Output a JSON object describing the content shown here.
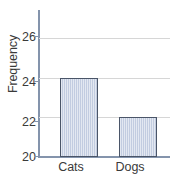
{
  "chart_data": {
    "type": "bar",
    "title": "",
    "subtitle": "",
    "xlabel": "",
    "ylabel": "Frequency",
    "categories": [
      "Cats",
      "Dogs"
    ],
    "values": [
      24,
      22
    ],
    "series": [
      {
        "name": "Frequency",
        "values": [
          24,
          22
        ]
      }
    ],
    "yticks": [
      20,
      22,
      24,
      26
    ],
    "ytick_labels": [
      "20",
      "22",
      "24",
      "26"
    ],
    "ylim": [
      20,
      26.8
    ],
    "xlim": [
      0,
      2
    ],
    "grid": "horizontal",
    "legend": "none",
    "annotations": []
  },
  "style": {
    "bar_fill": "#c2cce0",
    "bar_border": "#4a5568",
    "gridline_color": "#d6d6d6",
    "axis_color": "#8494ac",
    "text_color": "#3a3a3a",
    "background": "#ffffff"
  }
}
